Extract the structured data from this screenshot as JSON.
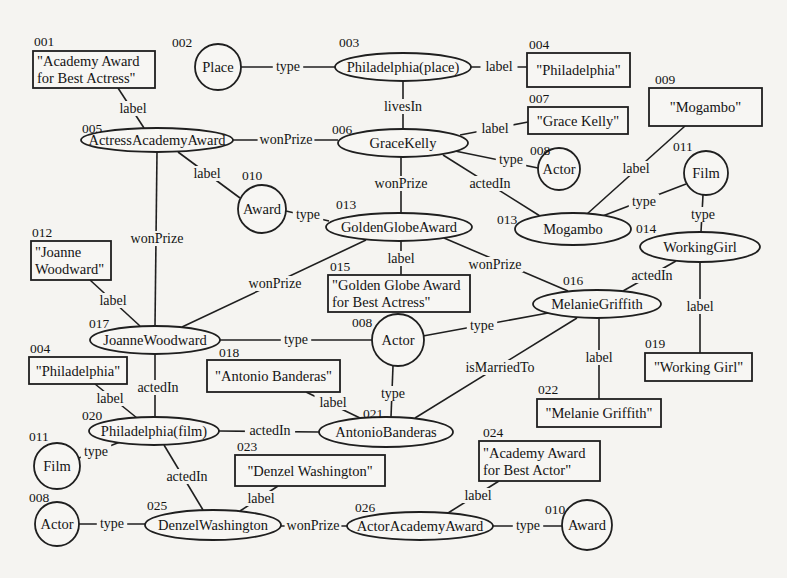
{
  "diagram": {
    "title": "",
    "nodes": [
      {
        "key": "n001",
        "id": "001",
        "shape": "box",
        "text": [
          "\"Academy Award",
          "for Best Actress\""
        ],
        "x": 33,
        "y": 51,
        "w": 122,
        "h": 37,
        "idx": 34,
        "idy": 46
      },
      {
        "key": "n002",
        "id": "002",
        "shape": "circle",
        "text": [
          "Place"
        ],
        "cx": 218,
        "cy": 67,
        "r": 23,
        "idx": 172,
        "idy": 47
      },
      {
        "key": "n003",
        "id": "003",
        "shape": "ellipse",
        "text": [
          "Philadelphia(place)"
        ],
        "cx": 403,
        "cy": 67,
        "rx": 68,
        "ry": 14,
        "idx": 339,
        "idy": 47
      },
      {
        "key": "n004a",
        "id": "004",
        "shape": "box",
        "text": [
          "\"Philadelphia\""
        ],
        "x": 527,
        "y": 53,
        "w": 103,
        "h": 34,
        "idx": 529,
        "idy": 49
      },
      {
        "key": "n005",
        "id": "005",
        "shape": "ellipse",
        "text": [
          "ActressAcademyAward"
        ],
        "cx": 157,
        "cy": 140,
        "rx": 76,
        "ry": 12,
        "idx": 82,
        "idy": 133
      },
      {
        "key": "n006",
        "id": "006",
        "shape": "ellipse",
        "text": [
          "GraceKelly"
        ],
        "cx": 403,
        "cy": 143,
        "rx": 65,
        "ry": 14,
        "idx": 332,
        "idy": 134
      },
      {
        "key": "n007",
        "id": "007",
        "shape": "box",
        "text": [
          "\"Grace Kelly\""
        ],
        "x": 528,
        "y": 107,
        "w": 100,
        "h": 27,
        "idx": 529,
        "idy": 103
      },
      {
        "key": "n008a",
        "id": "008",
        "shape": "circle",
        "text": [
          "Actor"
        ],
        "cx": 559,
        "cy": 169,
        "r": 21,
        "idx": 530,
        "idy": 155
      },
      {
        "key": "n009",
        "id": "009",
        "shape": "box",
        "text": [
          "\"Mogambo\""
        ],
        "x": 649,
        "y": 88,
        "w": 113,
        "h": 38,
        "idx": 655,
        "idy": 84
      },
      {
        "key": "n010a",
        "id": "010",
        "shape": "circle",
        "text": [
          "Award"
        ],
        "cx": 262,
        "cy": 209,
        "r": 24,
        "idx": 242,
        "idy": 180
      },
      {
        "key": "n011a",
        "id": "011",
        "shape": "circle",
        "text": [
          "Film"
        ],
        "cx": 706,
        "cy": 173,
        "r": 22,
        "idx": 673,
        "idy": 151
      },
      {
        "key": "n013a",
        "id": "013",
        "shape": "ellipse",
        "text": [
          "GoldenGlobeAward"
        ],
        "cx": 399,
        "cy": 227,
        "rx": 73,
        "ry": 14,
        "idx": 336,
        "idy": 209
      },
      {
        "key": "n013b",
        "id": "013",
        "shape": "ellipse",
        "text": [
          "Mogambo"
        ],
        "cx": 573,
        "cy": 229,
        "rx": 58,
        "ry": 16,
        "idx": 497,
        "idy": 224
      },
      {
        "key": "n014",
        "id": "014",
        "shape": "ellipse",
        "text": [
          "WorkingGirl"
        ],
        "cx": 700,
        "cy": 247,
        "rx": 60,
        "ry": 15,
        "idx": 636,
        "idy": 233
      },
      {
        "key": "n012",
        "id": "012",
        "shape": "box",
        "text": [
          "\"Joanne",
          "Woodward\""
        ],
        "x": 31,
        "y": 241,
        "w": 80,
        "h": 39,
        "idx": 32,
        "idy": 237
      },
      {
        "key": "n015",
        "id": "015",
        "shape": "box",
        "text": [
          "\"Golden Globe Award",
          "for Best Actress\""
        ],
        "x": 328,
        "y": 275,
        "w": 142,
        "h": 37,
        "idx": 330,
        "idy": 271
      },
      {
        "key": "n016",
        "id": "016",
        "shape": "ellipse",
        "text": [
          "MelanieGriffith"
        ],
        "cx": 597,
        "cy": 304,
        "rx": 64,
        "ry": 14,
        "idx": 563,
        "idy": 285
      },
      {
        "key": "n017",
        "id": "017",
        "shape": "ellipse",
        "text": [
          "JoanneWoodward"
        ],
        "cx": 155,
        "cy": 340,
        "rx": 65,
        "ry": 14,
        "idx": 89,
        "idy": 328
      },
      {
        "key": "n008b",
        "id": "008",
        "shape": "circle",
        "text": [
          "Actor"
        ],
        "cx": 398,
        "cy": 340,
        "r": 26,
        "idx": 352,
        "idy": 327
      },
      {
        "key": "n018",
        "id": "018",
        "shape": "box",
        "text": [
          "\"Antonio Banderas\""
        ],
        "x": 207,
        "y": 360,
        "w": 133,
        "h": 32,
        "idx": 219,
        "idy": 357
      },
      {
        "key": "n019",
        "id": "019",
        "shape": "box",
        "text": [
          "\"Working Girl\""
        ],
        "x": 645,
        "y": 353,
        "w": 107,
        "h": 28,
        "idx": 645,
        "idy": 348
      },
      {
        "key": "n004b",
        "id": "004",
        "shape": "box",
        "text": [
          "\"Philadelphia\""
        ],
        "x": 29,
        "y": 357,
        "w": 98,
        "h": 27,
        "idx": 30,
        "idy": 353
      },
      {
        "key": "n020",
        "id": "020",
        "shape": "ellipse",
        "text": [
          "Philadelphia(film)"
        ],
        "cx": 154,
        "cy": 431,
        "rx": 65,
        "ry": 14,
        "idx": 82,
        "idy": 420
      },
      {
        "key": "n021",
        "id": "021",
        "shape": "ellipse",
        "text": [
          "AntonioBanderas"
        ],
        "cx": 386,
        "cy": 432,
        "rx": 67,
        "ry": 15,
        "idx": 363,
        "idy": 418
      },
      {
        "key": "n022",
        "id": "022",
        "shape": "box",
        "text": [
          "\"Melanie Griffith\""
        ],
        "x": 537,
        "y": 399,
        "w": 124,
        "h": 28,
        "idx": 538,
        "idy": 394
      },
      {
        "key": "n011b",
        "id": "011",
        "shape": "circle",
        "text": [
          "Film"
        ],
        "cx": 57,
        "cy": 466,
        "r": 23,
        "idx": 29,
        "idy": 441
      },
      {
        "key": "n023",
        "id": "023",
        "shape": "box",
        "text": [
          "\"Denzel Washington\""
        ],
        "x": 235,
        "y": 455,
        "w": 150,
        "h": 31,
        "idx": 237,
        "idy": 451
      },
      {
        "key": "n024",
        "id": "024",
        "shape": "box",
        "text": [
          "\"Academy Award",
          "for Best Actor\""
        ],
        "x": 479,
        "y": 441,
        "w": 121,
        "h": 40,
        "idx": 483,
        "idy": 437
      },
      {
        "key": "n008c",
        "id": "008",
        "shape": "circle",
        "text": [
          "Actor"
        ],
        "cx": 57,
        "cy": 524,
        "r": 22,
        "idx": 29,
        "idy": 502
      },
      {
        "key": "n025",
        "id": "025",
        "shape": "ellipse",
        "text": [
          "DenzelWashington"
        ],
        "cx": 213,
        "cy": 525,
        "rx": 68,
        "ry": 15,
        "idx": 147,
        "idy": 510
      },
      {
        "key": "n026",
        "id": "026",
        "shape": "ellipse",
        "text": [
          "ActorAcademyAward"
        ],
        "cx": 420,
        "cy": 526,
        "rx": 73,
        "ry": 14,
        "idx": 355,
        "idy": 512
      },
      {
        "key": "n010b",
        "id": "010",
        "shape": "circle",
        "text": [
          "Award"
        ],
        "cx": 587,
        "cy": 525,
        "r": 25,
        "idx": 545,
        "idy": 514
      }
    ],
    "edges": [
      {
        "from": "n002",
        "to": "n003",
        "label": "type",
        "pts": [
          [
            241,
            67
          ],
          [
            335,
            67
          ]
        ],
        "lx": 288,
        "ly": 71
      },
      {
        "from": "n003",
        "to": "n004a",
        "label": "label",
        "pts": [
          [
            471,
            67
          ],
          [
            527,
            67
          ]
        ],
        "lx": 499,
        "ly": 71
      },
      {
        "from": "n001",
        "to": "n005",
        "label": "label",
        "pts": [
          [
            118,
            88
          ],
          [
            144,
            128
          ]
        ],
        "lx": 133,
        "ly": 113
      },
      {
        "from": "n003",
        "to": "n006",
        "label": "livesIn",
        "pts": [
          [
            403,
            81
          ],
          [
            403,
            129
          ]
        ],
        "lx": 403,
        "ly": 111
      },
      {
        "from": "n005",
        "to": "n006",
        "label": "wonPrize",
        "pts": [
          [
            233,
            140
          ],
          [
            338,
            140
          ]
        ],
        "lx": 286,
        "ly": 144
      },
      {
        "from": "n006",
        "to": "n007",
        "label": "label",
        "pts": [
          [
            460,
            135
          ],
          [
            528,
            122
          ]
        ],
        "lx": 495,
        "ly": 133
      },
      {
        "from": "n006",
        "to": "n008a",
        "label": "type",
        "pts": [
          [
            455,
            151
          ],
          [
            538,
            168
          ]
        ],
        "lx": 511,
        "ly": 164
      },
      {
        "from": "n006",
        "to": "n013b",
        "label": "actedIn",
        "pts": [
          [
            443,
            155
          ],
          [
            540,
            216
          ]
        ],
        "lx": 490,
        "ly": 188
      },
      {
        "from": "n009",
        "to": "n013b",
        "label": "label",
        "pts": [
          [
            685,
            126
          ],
          [
            587,
            214
          ]
        ],
        "lx": 636,
        "ly": 173
      },
      {
        "from": "n011a",
        "to": "n013b",
        "label": "type",
        "pts": [
          [
            686,
            184
          ],
          [
            600,
            217
          ]
        ],
        "lx": 644,
        "ly": 206
      },
      {
        "from": "n011a",
        "to": "n014",
        "label": "type",
        "pts": [
          [
            703,
            195
          ],
          [
            701,
            232
          ]
        ],
        "lx": 703,
        "ly": 219
      },
      {
        "from": "n005",
        "to": "n010a",
        "label": "label",
        "pts": [
          [
            178,
            152
          ],
          [
            240,
            198
          ]
        ],
        "lx": 207,
        "ly": 178
      },
      {
        "from": "n006",
        "to": "n013a",
        "label": "wonPrize",
        "pts": [
          [
            401,
            157
          ],
          [
            401,
            213
          ]
        ],
        "lx": 401,
        "ly": 188
      },
      {
        "from": "n010a",
        "to": "n013a",
        "label": "type",
        "pts": [
          [
            286,
            211
          ],
          [
            329,
            221
          ]
        ],
        "lx": 308,
        "ly": 219
      },
      {
        "from": "n005",
        "to": "n017",
        "label": "wonPrize",
        "pts": [
          [
            157,
            152
          ],
          [
            155,
            326
          ]
        ],
        "lx": 157,
        "ly": 243
      },
      {
        "from": "n013a",
        "to": "n015",
        "label": "label",
        "pts": [
          [
            401,
            241
          ],
          [
            401,
            275
          ]
        ],
        "lx": 401,
        "ly": 263
      },
      {
        "from": "n013a",
        "to": "n016",
        "label": "wonPrize",
        "pts": [
          [
            444,
            238
          ],
          [
            568,
            291
          ]
        ],
        "lx": 495,
        "ly": 269
      },
      {
        "from": "n013a",
        "to": "n017",
        "label": "wonPrize",
        "pts": [
          [
            366,
            240
          ],
          [
            182,
            327
          ]
        ],
        "lx": 275,
        "ly": 288
      },
      {
        "from": "n014",
        "to": "n016",
        "label": "actedIn",
        "pts": [
          [
            676,
            261
          ],
          [
            623,
            291
          ]
        ],
        "lx": 652,
        "ly": 280
      },
      {
        "from": "n014",
        "to": "n019",
        "label": "label",
        "pts": [
          [
            700,
            262
          ],
          [
            700,
            353
          ]
        ],
        "lx": 700,
        "ly": 311
      },
      {
        "from": "n012",
        "to": "n017",
        "label": "label",
        "pts": [
          [
            90,
            280
          ],
          [
            140,
            326
          ]
        ],
        "lx": 113,
        "ly": 305
      },
      {
        "from": "n017",
        "to": "n008b",
        "label": "type",
        "pts": [
          [
            220,
            340
          ],
          [
            372,
            340
          ]
        ],
        "lx": 296,
        "ly": 344
      },
      {
        "from": "n016",
        "to": "n008b",
        "label": "type",
        "pts": [
          [
            548,
            313
          ],
          [
            423,
            336
          ]
        ],
        "lx": 482,
        "ly": 330
      },
      {
        "from": "n016",
        "to": "n021",
        "label": "isMarriedTo",
        "pts": [
          [
            577,
            318
          ],
          [
            415,
            418
          ]
        ],
        "lx": 500,
        "ly": 372
      },
      {
        "from": "n016",
        "to": "n022",
        "label": "label",
        "pts": [
          [
            599,
            318
          ],
          [
            599,
            399
          ]
        ],
        "lx": 599,
        "ly": 362
      },
      {
        "from": "n017",
        "to": "n020",
        "label": "actedIn",
        "pts": [
          [
            155,
            354
          ],
          [
            155,
            417
          ]
        ],
        "lx": 158,
        "ly": 392
      },
      {
        "from": "n004b",
        "to": "n020",
        "label": "label",
        "pts": [
          [
            95,
            384
          ],
          [
            137,
            418
          ]
        ],
        "lx": 110,
        "ly": 403
      },
      {
        "from": "n008b",
        "to": "n021",
        "label": "type",
        "pts": [
          [
            393,
            366
          ],
          [
            391,
            417
          ]
        ],
        "lx": 393,
        "ly": 398
      },
      {
        "from": "n018",
        "to": "n021",
        "label": "label",
        "pts": [
          [
            306,
            392
          ],
          [
            360,
            418
          ]
        ],
        "lx": 333,
        "ly": 407
      },
      {
        "from": "n020",
        "to": "n021",
        "label": "actedIn",
        "pts": [
          [
            219,
            431
          ],
          [
            319,
            432
          ]
        ],
        "lx": 270,
        "ly": 435
      },
      {
        "from": "n011b",
        "to": "n020",
        "label": "type",
        "pts": [
          [
            79,
            458
          ],
          [
            120,
            442
          ]
        ],
        "lx": 96,
        "ly": 456
      },
      {
        "from": "n020",
        "to": "n025",
        "label": "actedIn",
        "pts": [
          [
            164,
            445
          ],
          [
            203,
            510
          ]
        ],
        "lx": 187,
        "ly": 481
      },
      {
        "from": "n023",
        "to": "n025",
        "label": "label",
        "pts": [
          [
            278,
            486
          ],
          [
            240,
            511
          ]
        ],
        "lx": 261,
        "ly": 503
      },
      {
        "from": "n008c",
        "to": "n025",
        "label": "type",
        "pts": [
          [
            79,
            524
          ],
          [
            145,
            524
          ]
        ],
        "lx": 112,
        "ly": 528
      },
      {
        "from": "n025",
        "to": "n026",
        "label": "wonPrize",
        "pts": [
          [
            281,
            526
          ],
          [
            347,
            526
          ]
        ],
        "lx": 313,
        "ly": 530
      },
      {
        "from": "n024",
        "to": "n026",
        "label": "label",
        "pts": [
          [
            499,
            481
          ],
          [
            448,
            513
          ]
        ],
        "lx": 478,
        "ly": 500
      },
      {
        "from": "n026",
        "to": "n010b",
        "label": "type",
        "pts": [
          [
            493,
            526
          ],
          [
            562,
            526
          ]
        ],
        "lx": 528,
        "ly": 530
      }
    ]
  }
}
